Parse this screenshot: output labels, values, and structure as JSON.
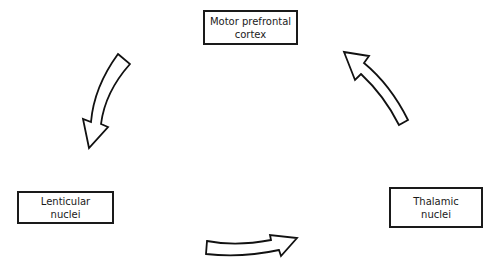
{
  "diagram": {
    "type": "cycle",
    "nodes": [
      {
        "id": "motor",
        "label": "Motor prefrontal\ncortex"
      },
      {
        "id": "lenticular",
        "label": "Lenticular\nnuclei"
      },
      {
        "id": "thalamic",
        "label": "Thalamic\nnuclei"
      }
    ],
    "edges": [
      {
        "from": "motor",
        "to": "lenticular"
      },
      {
        "from": "lenticular",
        "to": "thalamic"
      },
      {
        "from": "thalamic",
        "to": "motor"
      }
    ],
    "colors": {
      "stroke": "#1a1a1a",
      "fill": "#ffffff"
    }
  }
}
